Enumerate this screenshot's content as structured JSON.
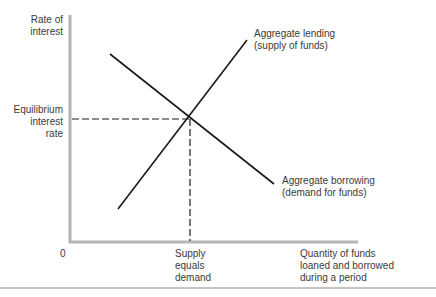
{
  "diagram": {
    "type": "supply-demand",
    "y_axis_label": [
      "Rate of",
      "interest"
    ],
    "x_axis_label": [
      "Quantity of funds",
      "loaned and borrowed",
      "during a period"
    ],
    "origin_label": "0",
    "equilibrium_rate_label": [
      "Equilibrium",
      "interest",
      "rate"
    ],
    "equilibrium_quantity_label": [
      "Supply",
      "equals",
      "demand"
    ],
    "supply_curve_label": [
      "Aggregate lending",
      "(supply of funds)"
    ],
    "demand_curve_label": [
      "Aggregate borrowing",
      "(demand for funds)"
    ],
    "colors": {
      "axis": "#b5b5b5",
      "curve": "#1a1a1a",
      "text": "#3a3a3a",
      "rule": "#888888"
    }
  }
}
